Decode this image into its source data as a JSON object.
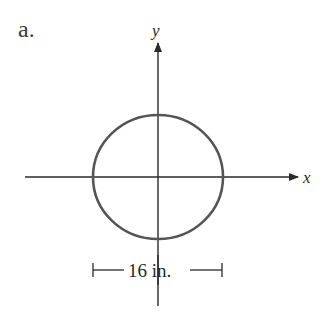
{
  "figure": {
    "part_label": "a.",
    "x_axis_label": "x",
    "y_axis_label": "y",
    "shape": "circle",
    "dimension_label": "16 in.",
    "dimension_value": 16,
    "dimension_unit": "in.",
    "colors": {
      "axis": "#2a2a2a",
      "circle": "#555555",
      "background": "#ffffff"
    }
  }
}
